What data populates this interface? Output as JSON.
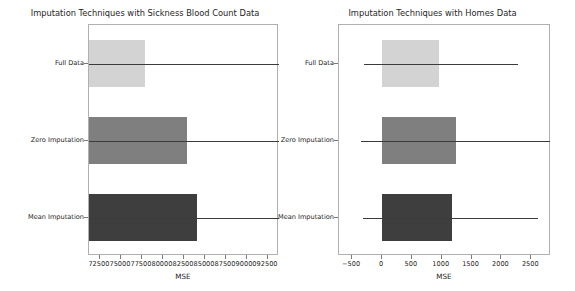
{
  "figure": {
    "width": 575,
    "height": 291,
    "background": "#ffffff",
    "panel_count": 2
  },
  "palette": {
    "bar_light": "#d3d3d3",
    "bar_mid": "#7f7f7f",
    "bar_dark": "#3e3e3e",
    "error_bar": "#3b3b3b",
    "axis_line": "#b0b0b0",
    "text": "#262626"
  },
  "chart_data": [
    {
      "type": "bar",
      "orientation": "horizontal",
      "id": "sickness-blood-count",
      "title": "Imputation Techniques with Sickness Blood Count Data",
      "xlabel": "MSE",
      "ylabel": "",
      "categories": [
        "Full Data",
        "Zero Imputation",
        "Mean Imputation"
      ],
      "values": [
        77900,
        82800,
        84000
      ],
      "error_low": [
        71200,
        71200,
        71200
      ],
      "error_high": [
        93800,
        93800,
        93800
      ],
      "xlim": [
        71200,
        93800
      ],
      "ylim": [
        -0.5,
        2.5
      ],
      "xticks": [
        72500,
        75000,
        77500,
        80000,
        82500,
        85000,
        87500,
        90000,
        92500
      ],
      "xticklabels": [
        "72500",
        "75000",
        "77500",
        "80000",
        "82500",
        "85000",
        "87500",
        "90000",
        "92500"
      ],
      "grid": false,
      "legend": false,
      "bar_colors": [
        "#d3d3d3",
        "#7f7f7f",
        "#3e3e3e"
      ]
    },
    {
      "type": "bar",
      "orientation": "horizontal",
      "id": "homes",
      "title": "Imputation Techniques with Homes Data",
      "xlabel": "MSE",
      "ylabel": "",
      "categories": [
        "Full Data",
        "Zero Imputation",
        "Mean Imputation"
      ],
      "values": [
        960,
        1240,
        1170
      ],
      "error_low": [
        -300,
        -350,
        -310
      ],
      "error_high": [
        2270,
        2820,
        2620
      ],
      "xlim": [
        -720,
        2830
      ],
      "ylim": [
        -0.5,
        2.5
      ],
      "xticks": [
        -500,
        0,
        500,
        1000,
        1500,
        2000,
        2500
      ],
      "xticklabels": [
        "−500",
        "0",
        "500",
        "1000",
        "1500",
        "2000",
        "2500"
      ],
      "grid": false,
      "legend": false,
      "bar_colors": [
        "#d3d3d3",
        "#7f7f7f",
        "#3e3e3e"
      ]
    }
  ]
}
